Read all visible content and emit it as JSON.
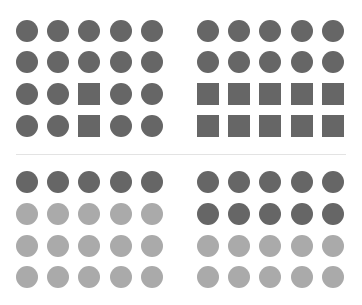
{
  "figure": {
    "title": "",
    "colors": {
      "dark": "#666666",
      "light": "#aaaaaa",
      "divider": "#e3e3e3",
      "background": "#ffffff"
    },
    "panels": [
      {
        "id": "top-left",
        "principle": "similarity-shape",
        "rows": [
          [
            {
              "shape": "circle",
              "tone": "dark"
            },
            {
              "shape": "circle",
              "tone": "dark"
            },
            {
              "shape": "circle",
              "tone": "dark"
            },
            {
              "shape": "circle",
              "tone": "dark"
            },
            {
              "shape": "circle",
              "tone": "dark"
            }
          ],
          [
            {
              "shape": "circle",
              "tone": "dark"
            },
            {
              "shape": "circle",
              "tone": "dark"
            },
            {
              "shape": "circle",
              "tone": "dark"
            },
            {
              "shape": "circle",
              "tone": "dark"
            },
            {
              "shape": "circle",
              "tone": "dark"
            }
          ],
          [
            {
              "shape": "circle",
              "tone": "dark"
            },
            {
              "shape": "circle",
              "tone": "dark"
            },
            {
              "shape": "square",
              "tone": "dark"
            },
            {
              "shape": "circle",
              "tone": "dark"
            },
            {
              "shape": "circle",
              "tone": "dark"
            }
          ],
          [
            {
              "shape": "circle",
              "tone": "dark"
            },
            {
              "shape": "circle",
              "tone": "dark"
            },
            {
              "shape": "square",
              "tone": "dark"
            },
            {
              "shape": "circle",
              "tone": "dark"
            },
            {
              "shape": "circle",
              "tone": "dark"
            }
          ]
        ]
      },
      {
        "id": "top-right",
        "principle": "similarity-shape",
        "rows": [
          [
            {
              "shape": "circle",
              "tone": "dark"
            },
            {
              "shape": "circle",
              "tone": "dark"
            },
            {
              "shape": "circle",
              "tone": "dark"
            },
            {
              "shape": "circle",
              "tone": "dark"
            },
            {
              "shape": "circle",
              "tone": "dark"
            }
          ],
          [
            {
              "shape": "circle",
              "tone": "dark"
            },
            {
              "shape": "circle",
              "tone": "dark"
            },
            {
              "shape": "circle",
              "tone": "dark"
            },
            {
              "shape": "circle",
              "tone": "dark"
            },
            {
              "shape": "circle",
              "tone": "dark"
            }
          ],
          [
            {
              "shape": "square",
              "tone": "dark"
            },
            {
              "shape": "square",
              "tone": "dark"
            },
            {
              "shape": "square",
              "tone": "dark"
            },
            {
              "shape": "square",
              "tone": "dark"
            },
            {
              "shape": "square",
              "tone": "dark"
            }
          ],
          [
            {
              "shape": "square",
              "tone": "dark"
            },
            {
              "shape": "square",
              "tone": "dark"
            },
            {
              "shape": "square",
              "tone": "dark"
            },
            {
              "shape": "square",
              "tone": "dark"
            },
            {
              "shape": "square",
              "tone": "dark"
            }
          ]
        ]
      },
      {
        "id": "bottom-left",
        "principle": "similarity-color",
        "rows": [
          [
            {
              "shape": "circle",
              "tone": "dark"
            },
            {
              "shape": "circle",
              "tone": "dark"
            },
            {
              "shape": "circle",
              "tone": "dark"
            },
            {
              "shape": "circle",
              "tone": "dark"
            },
            {
              "shape": "circle",
              "tone": "dark"
            }
          ],
          [
            {
              "shape": "circle",
              "tone": "light"
            },
            {
              "shape": "circle",
              "tone": "light"
            },
            {
              "shape": "circle",
              "tone": "light"
            },
            {
              "shape": "circle",
              "tone": "light"
            },
            {
              "shape": "circle",
              "tone": "light"
            }
          ],
          [
            {
              "shape": "circle",
              "tone": "light"
            },
            {
              "shape": "circle",
              "tone": "light"
            },
            {
              "shape": "circle",
              "tone": "light"
            },
            {
              "shape": "circle",
              "tone": "light"
            },
            {
              "shape": "circle",
              "tone": "light"
            }
          ],
          [
            {
              "shape": "circle",
              "tone": "light"
            },
            {
              "shape": "circle",
              "tone": "light"
            },
            {
              "shape": "circle",
              "tone": "light"
            },
            {
              "shape": "circle",
              "tone": "light"
            },
            {
              "shape": "circle",
              "tone": "light"
            }
          ]
        ]
      },
      {
        "id": "bottom-right",
        "principle": "similarity-color",
        "rows": [
          [
            {
              "shape": "circle",
              "tone": "dark"
            },
            {
              "shape": "circle",
              "tone": "dark"
            },
            {
              "shape": "circle",
              "tone": "dark"
            },
            {
              "shape": "circle",
              "tone": "dark"
            },
            {
              "shape": "circle",
              "tone": "dark"
            }
          ],
          [
            {
              "shape": "circle",
              "tone": "dark"
            },
            {
              "shape": "circle",
              "tone": "dark"
            },
            {
              "shape": "circle",
              "tone": "dark"
            },
            {
              "shape": "circle",
              "tone": "dark"
            },
            {
              "shape": "circle",
              "tone": "dark"
            }
          ],
          [
            {
              "shape": "circle",
              "tone": "light"
            },
            {
              "shape": "circle",
              "tone": "light"
            },
            {
              "shape": "circle",
              "tone": "light"
            },
            {
              "shape": "circle",
              "tone": "light"
            },
            {
              "shape": "circle",
              "tone": "light"
            }
          ],
          [
            {
              "shape": "circle",
              "tone": "light"
            },
            {
              "shape": "circle",
              "tone": "light"
            },
            {
              "shape": "circle",
              "tone": "light"
            },
            {
              "shape": "circle",
              "tone": "light"
            },
            {
              "shape": "circle",
              "tone": "light"
            }
          ]
        ]
      }
    ]
  }
}
